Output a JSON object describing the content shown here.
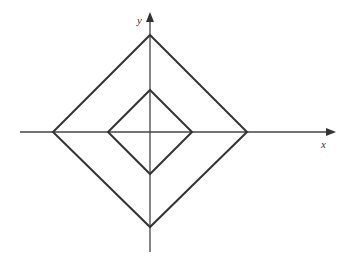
{
  "diagram": {
    "type": "coordinate-plane-nested-diamonds",
    "axes": {
      "x_label": "x",
      "y_label": "y"
    },
    "shapes": [
      {
        "name": "outer-diamond",
        "vertices": [
          [
            150,
            35
          ],
          [
            247,
            132
          ],
          [
            150,
            227
          ],
          [
            53,
            132
          ]
        ]
      },
      {
        "name": "inner-diamond",
        "vertices": [
          [
            150,
            90
          ],
          [
            192,
            132
          ],
          [
            150,
            174
          ],
          [
            108,
            132
          ]
        ]
      }
    ],
    "stroke_color": "#333333"
  }
}
